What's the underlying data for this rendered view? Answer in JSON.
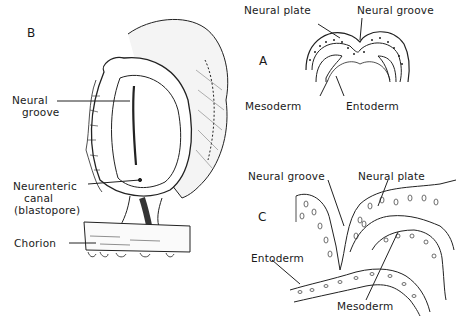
{
  "figure": {
    "panels": {
      "A": {
        "letter": "A",
        "labels": {
          "neural_plate": "Neural plate",
          "neural_groove": "Neural groove",
          "mesoderm": "Mesoderm",
          "entoderm": "Entoderm"
        }
      },
      "B": {
        "letter": "B",
        "labels": {
          "neural_groove_1": "Neural",
          "neural_groove_2": "groove",
          "neurenteric_1": "Neurenteric",
          "neurenteric_2": "canal",
          "neurenteric_3": "(blastopore)",
          "chorion": "Chorion"
        }
      },
      "C": {
        "letter": "C",
        "labels": {
          "neural_groove": "Neural groove",
          "neural_plate": "Neural plate",
          "entoderm": "Entoderm",
          "mesoderm": "Mesoderm"
        }
      }
    }
  }
}
